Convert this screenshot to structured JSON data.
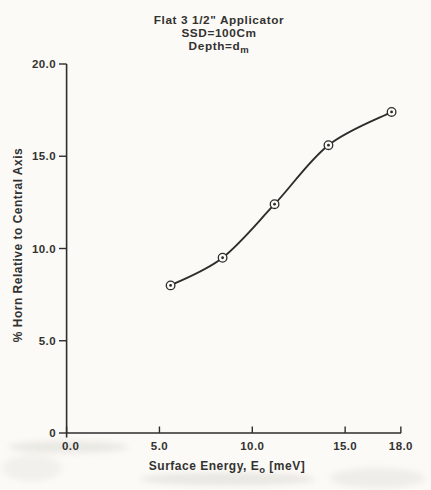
{
  "figure": {
    "kind": "scanned scientific line chart",
    "ink_color": "#2e2d2b",
    "paper_color": "#fbfaf6"
  },
  "labels": {
    "title1": "Flat 3 1/2\" Applicator",
    "title2": "SSD=100Cm",
    "title3_main": "Depth=d",
    "title3_sub": "m",
    "xlabel_main": "Surface Energy, E",
    "xlabel_sub": "o",
    "xlabel_unit": " [meV]",
    "ylabel": "% Horn Relative to Central Axis"
  },
  "chart_data": {
    "type": "line",
    "title_lines": [
      "Flat 3 1/2\" Applicator",
      "SSD=100Cm",
      "Depth=d_m"
    ],
    "xlabel": "Surface Energy, E_o [meV]",
    "ylabel": "% Horn Relative to Central Axis",
    "x": [
      5.6,
      8.4,
      11.2,
      14.1,
      17.5
    ],
    "y": [
      8.0,
      9.5,
      12.4,
      15.6,
      17.4
    ],
    "xlim": [
      0,
      18
    ],
    "ylim": [
      0,
      20
    ],
    "x_ticks": [
      0,
      5,
      10,
      15,
      18
    ],
    "x_tick_labels": [
      "0.0",
      "5.0",
      "10.0",
      "15.0",
      "18.0"
    ],
    "y_ticks": [
      0,
      5,
      10,
      15,
      20
    ],
    "y_tick_labels": [
      "0",
      "5.0",
      "10.0",
      "15.0",
      "20.0"
    ],
    "grid": false,
    "legend": null,
    "marker": "circled-dot",
    "line_color": "#2e2d2b"
  }
}
